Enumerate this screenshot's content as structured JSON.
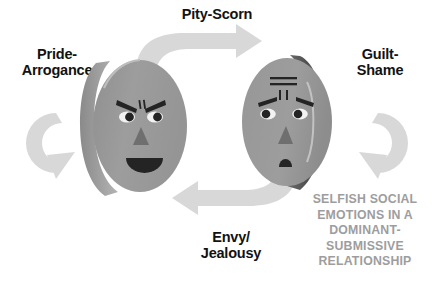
{
  "diagram": {
    "title_caption": {
      "lines": [
        "SELFISH SOCIAL",
        "EMOTIONS IN A",
        "DOMINANT-",
        "SUBMISSIVE",
        "RELATIONSHIP"
      ],
      "color": "#9d9d9d"
    },
    "labels": {
      "top": "Pity-Scorn",
      "left_line1": "Pride-",
      "left_line2": "Arrogance",
      "right_line1": "Guilt-",
      "right_line2": "Shame",
      "bottom_line1": "Envy/",
      "bottom_line2": "Jealousy",
      "color": "#121212"
    },
    "figures": [
      {
        "name": "dominant-face",
        "role": "dominant",
        "expression": "angry-proud-laughing",
        "features": [
          "angry-eyebrows",
          "frown-lines",
          "eyes-with-pupils",
          "triangle-nose",
          "open-laughing-mouth"
        ]
      },
      {
        "name": "submissive-face",
        "role": "submissive",
        "expression": "worried-ashamed",
        "features": [
          "forehead-lines",
          "vertical-worry-lines",
          "sad-eyebrows",
          "eyes-with-pupils",
          "triangle-nose",
          "small-sad-mouth"
        ]
      }
    ],
    "arrows": [
      {
        "name": "arrow-top",
        "direction": "left-to-right",
        "label": "Pity-Scorn"
      },
      {
        "name": "arrow-bottom",
        "direction": "right-to-left",
        "label": "Envy/Jealousy"
      },
      {
        "name": "arrow-left-loop",
        "direction": "clockwise",
        "label": "Pride-Arrogance"
      },
      {
        "name": "arrow-right-loop",
        "direction": "clockwise",
        "label": "Guilt-Shame"
      }
    ],
    "colors": {
      "face_fill": "#9b9b9b",
      "face_rim_dark": "#6e6e6e",
      "face_feature": "#242424",
      "arrow_fill": "#d8d8d8",
      "background": "#ffffff"
    }
  }
}
